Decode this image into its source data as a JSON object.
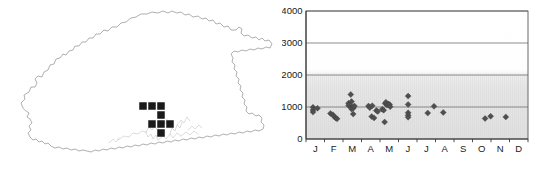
{
  "figure": {
    "panels": [
      "distribution-map",
      "altitude-month-scatter"
    ]
  },
  "map": {
    "region_name": "Bhutan",
    "outline_color": "#8e8e8e",
    "record_marker_color": "#1a1a1a",
    "river_color": "#b9b9b9",
    "record_count": 8,
    "records": [
      {
        "id": "rec-1",
        "x": 143,
        "y": 106
      },
      {
        "id": "rec-2",
        "x": 152,
        "y": 106
      },
      {
        "id": "rec-3",
        "x": 161,
        "y": 106
      },
      {
        "id": "rec-4",
        "x": 161,
        "y": 115
      },
      {
        "id": "rec-5",
        "x": 161,
        "y": 124
      },
      {
        "id": "rec-6",
        "x": 170,
        "y": 124
      },
      {
        "id": "rec-7",
        "x": 161,
        "y": 133
      },
      {
        "id": "rec-8",
        "x": 152,
        "y": 124
      }
    ],
    "record_square_size": 7.5
  },
  "chart_data": {
    "type": "scatter",
    "title": "",
    "xlabel": "",
    "ylabel": "",
    "xlim": [
      0.5,
      12.5
    ],
    "ylim": [
      0,
      4000
    ],
    "grid": true,
    "gridlines_y": [
      1000,
      2000,
      3000,
      4000
    ],
    "legend": null,
    "yticks": [
      0,
      1000,
      2000,
      3000,
      4000
    ],
    "ytick_labels": [
      "0",
      "1000",
      "2000",
      "3000",
      "4000"
    ],
    "xticks": [
      1,
      2,
      3,
      4,
      5,
      6,
      7,
      8,
      9,
      10,
      11,
      12
    ],
    "xtick_labels": [
      "J",
      "F",
      "M",
      "A",
      "M",
      "J",
      "J",
      "A",
      "S",
      "O",
      "N",
      "D"
    ],
    "marker_shape": "diamond",
    "marker_color": "#4f4f4f",
    "plot_background_top": "#ffffff",
    "plot_background_low": "#e4e4e4",
    "points": [
      {
        "month": 1,
        "x": 0.88,
        "y": 990
      },
      {
        "month": 1,
        "x": 0.88,
        "y": 910
      },
      {
        "month": 1,
        "x": 0.88,
        "y": 840
      },
      {
        "month": 1,
        "x": 1.12,
        "y": 960
      },
      {
        "month": 2,
        "x": 1.82,
        "y": 800
      },
      {
        "month": 2,
        "x": 1.95,
        "y": 760
      },
      {
        "month": 2,
        "x": 2.02,
        "y": 700
      },
      {
        "month": 2,
        "x": 2.12,
        "y": 650
      },
      {
        "month": 2,
        "x": 2.18,
        "y": 630
      },
      {
        "month": 3,
        "x": 2.8,
        "y": 1120
      },
      {
        "month": 3,
        "x": 2.8,
        "y": 1050
      },
      {
        "month": 3,
        "x": 2.92,
        "y": 1390
      },
      {
        "month": 3,
        "x": 2.96,
        "y": 1170
      },
      {
        "month": 3,
        "x": 2.96,
        "y": 1000
      },
      {
        "month": 3,
        "x": 2.96,
        "y": 940
      },
      {
        "month": 3,
        "x": 3.05,
        "y": 1010
      },
      {
        "month": 3,
        "x": 3.05,
        "y": 960
      },
      {
        "month": 3,
        "x": 3.05,
        "y": 780
      },
      {
        "month": 3,
        "x": 3.12,
        "y": 1030
      },
      {
        "month": 4,
        "x": 3.88,
        "y": 1030
      },
      {
        "month": 4,
        "x": 3.95,
        "y": 980
      },
      {
        "month": 4,
        "x": 4.08,
        "y": 1040
      },
      {
        "month": 4,
        "x": 4.05,
        "y": 700
      },
      {
        "month": 4,
        "x": 4.18,
        "y": 660
      },
      {
        "month": 4,
        "x": 4.3,
        "y": 890
      },
      {
        "month": 4,
        "x": 4.38,
        "y": 860
      },
      {
        "month": 5,
        "x": 4.62,
        "y": 930
      },
      {
        "month": 5,
        "x": 4.7,
        "y": 900
      },
      {
        "month": 5,
        "x": 4.78,
        "y": 1110
      },
      {
        "month": 5,
        "x": 4.82,
        "y": 1150
      },
      {
        "month": 5,
        "x": 4.88,
        "y": 1060
      },
      {
        "month": 5,
        "x": 4.95,
        "y": 1090
      },
      {
        "month": 5,
        "x": 5.02,
        "y": 1080
      },
      {
        "month": 5,
        "x": 5.05,
        "y": 1010
      },
      {
        "month": 5,
        "x": 4.75,
        "y": 530
      },
      {
        "month": 6,
        "x": 6.02,
        "y": 1340
      },
      {
        "month": 6,
        "x": 6.02,
        "y": 1080
      },
      {
        "month": 6,
        "x": 6.02,
        "y": 820
      },
      {
        "month": 6,
        "x": 6.02,
        "y": 740
      },
      {
        "month": 6,
        "x": 6.02,
        "y": 680
      },
      {
        "month": 7,
        "x": 7.08,
        "y": 810
      },
      {
        "month": 7,
        "x": 7.42,
        "y": 1020
      },
      {
        "month": 8,
        "x": 7.92,
        "y": 830
      },
      {
        "month": 10,
        "x": 10.18,
        "y": 640
      },
      {
        "month": 10,
        "x": 10.48,
        "y": 710
      },
      {
        "month": 11,
        "x": 11.3,
        "y": 690
      }
    ]
  }
}
